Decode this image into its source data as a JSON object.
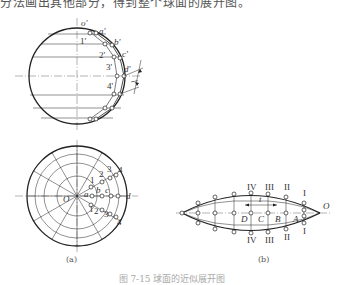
{
  "header_text": "分法画出其他部分，得到整个球面的展开图。",
  "figure_a": {
    "label": "(a)",
    "front_view": {
      "point_labels": [
        "o'",
        "a'",
        "b'",
        "c'",
        "d'"
      ],
      "ring_labels": [
        "1'",
        "2'",
        "3'",
        "4'"
      ],
      "dimension_label": "l"
    },
    "top_view": {
      "center_label": "O",
      "point_labels": [
        "a",
        "b",
        "c",
        "d"
      ],
      "upper_numbers": [
        "1",
        "2",
        "3",
        "4"
      ],
      "lower_numbers": [
        "1",
        "2",
        "3",
        "4"
      ]
    }
  },
  "figure_b": {
    "label": "(b)",
    "upper_roman": [
      "IV",
      "III",
      "II",
      "I"
    ],
    "lower_roman": [
      "IV",
      "III",
      "II",
      "I"
    ],
    "point_labels": [
      "D",
      "C",
      "B",
      "A"
    ],
    "end_label": "O",
    "dimension_label": "t"
  },
  "caption": "图 7-15 球面的近似展开图"
}
